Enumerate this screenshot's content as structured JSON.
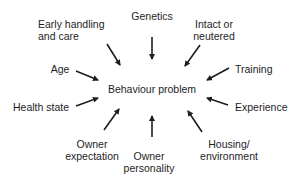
{
  "diagram": {
    "title": "Behaviour problem",
    "center": {
      "label": "Behaviour problem",
      "x": 152,
      "y": 89
    },
    "arrow_color": "#1e1e1e",
    "factors": [
      {
        "id": "genetics",
        "lines": [
          "Genetics"
        ],
        "x": 152,
        "y": 10,
        "align": "c",
        "arrow": {
          "x1": 152,
          "y1": 37,
          "x2": 152,
          "y2": 59
        }
      },
      {
        "id": "early-handling",
        "lines": [
          "Early handling",
          "and care"
        ],
        "x": 38,
        "y": 18,
        "align": "l",
        "arrow": {
          "x1": 107,
          "y1": 44,
          "x2": 120,
          "y2": 65
        }
      },
      {
        "id": "intact-neutered",
        "lines": [
          "Intact or",
          "neutered"
        ],
        "x": 214,
        "y": 18,
        "align": "c",
        "arrow": {
          "x1": 200,
          "y1": 45,
          "x2": 185,
          "y2": 66
        }
      },
      {
        "id": "age",
        "lines": [
          "Age"
        ],
        "x": 60,
        "y": 63,
        "align": "c",
        "arrow": {
          "x1": 76,
          "y1": 71,
          "x2": 98,
          "y2": 80
        }
      },
      {
        "id": "training",
        "lines": [
          "Training"
        ],
        "x": 235,
        "y": 63,
        "align": "l",
        "arrow": {
          "x1": 229,
          "y1": 68,
          "x2": 207,
          "y2": 80
        }
      },
      {
        "id": "health-state",
        "lines": [
          "Health state"
        ],
        "x": 13,
        "y": 101,
        "align": "l",
        "arrow": {
          "x1": 76,
          "y1": 106,
          "x2": 98,
          "y2": 98
        }
      },
      {
        "id": "experience",
        "lines": [
          "Experience"
        ],
        "x": 235,
        "y": 101,
        "align": "l",
        "arrow": {
          "x1": 228,
          "y1": 105,
          "x2": 207,
          "y2": 98
        }
      },
      {
        "id": "owner-expectation",
        "lines": [
          "Owner",
          "expectation"
        ],
        "x": 92,
        "y": 138,
        "align": "c",
        "arrow": {
          "x1": 104,
          "y1": 130,
          "x2": 119,
          "y2": 109
        }
      },
      {
        "id": "owner-personality",
        "lines": [
          "Owner",
          "personality"
        ],
        "x": 149,
        "y": 150,
        "align": "c",
        "arrow": {
          "x1": 152,
          "y1": 137,
          "x2": 152,
          "y2": 116
        }
      },
      {
        "id": "housing-environment",
        "lines": [
          "Housing/",
          "environment"
        ],
        "x": 229,
        "y": 138,
        "align": "c",
        "arrow": {
          "x1": 202,
          "y1": 132,
          "x2": 188,
          "y2": 111
        }
      }
    ]
  }
}
